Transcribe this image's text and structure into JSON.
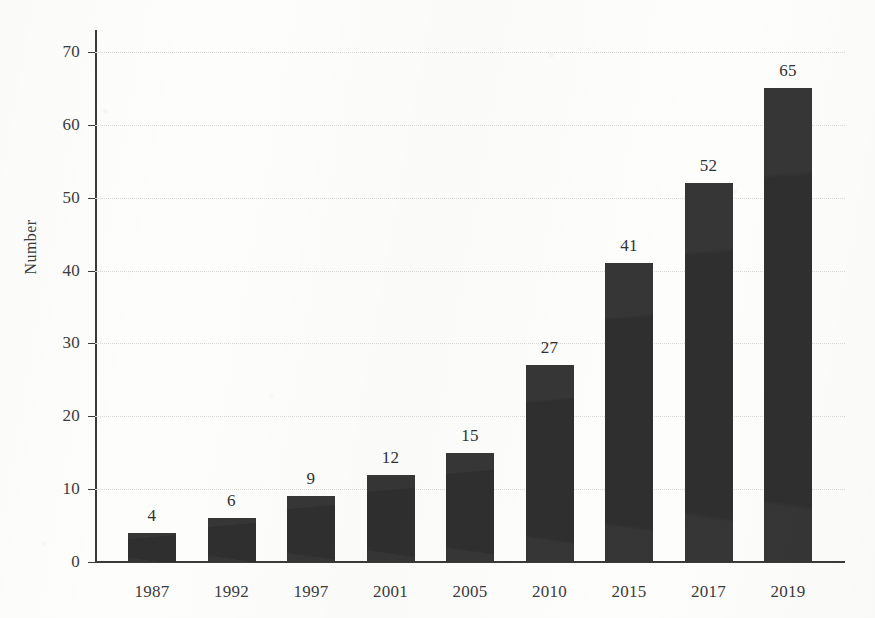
{
  "figure": {
    "background_color": "#fdfdfc",
    "bar_color": "#2f2f2f",
    "axis_color": "#3a3a3a",
    "grid_color": "#d9d9d6"
  },
  "chart_data": {
    "type": "bar",
    "title": "",
    "subtitle": "",
    "xlabel": "",
    "ylabel": "Number",
    "categories": [
      "1987",
      "1992",
      "1997",
      "2001",
      "2005",
      "2010",
      "2015",
      "2017",
      "2019"
    ],
    "values": [
      4,
      6,
      9,
      12,
      15,
      27,
      41,
      52,
      65
    ],
    "data_labels": [
      "4",
      "6",
      "9",
      "12",
      "15",
      "27",
      "41",
      "52",
      "65"
    ],
    "ylim": [
      0,
      70
    ],
    "ytick_labels": [
      "0",
      "10",
      "20",
      "30",
      "40",
      "50",
      "60",
      "70"
    ],
    "ytick_values": [
      0,
      10,
      20,
      30,
      40,
      50,
      60,
      70
    ],
    "grid": "horizontal-dotted",
    "legend": "none",
    "legend_position": "none",
    "annotations": []
  }
}
